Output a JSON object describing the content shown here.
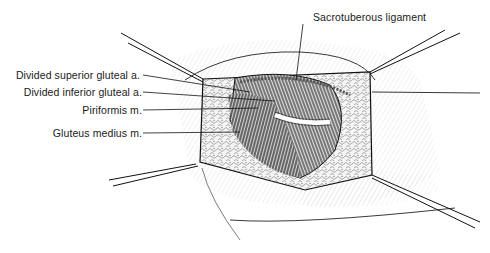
{
  "figure": {
    "type": "surgical illustration",
    "labels": [
      {
        "id": "sacrotuberous",
        "text": "Sacrotuberous ligament"
      },
      {
        "id": "sup-gluteal",
        "text": "Divided superior gluteal a."
      },
      {
        "id": "inf-gluteal",
        "text": "Divided inferior gluteal a."
      },
      {
        "id": "piriformis",
        "text": "Piriformis m."
      },
      {
        "id": "gluteus-medius",
        "text": "Gluteus medius m."
      }
    ]
  }
}
